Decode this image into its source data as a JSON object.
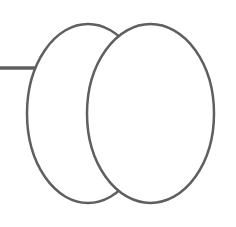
{
  "diagram": {
    "background": "#ffffff",
    "stroke_color": "#5f5f5f",
    "shapes": {
      "connector_line": {
        "x1": 0,
        "y1": 68,
        "x2": 36,
        "y2": 68,
        "stroke_width": 3.5
      },
      "back_ellipse": {
        "cx": 88,
        "cy": 113.5,
        "rx": 61,
        "ry": 89.5,
        "stroke_width": 2.5
      },
      "front_ellipse": {
        "cx": 150.5,
        "cy": 113.5,
        "rx": 63.5,
        "ry": 89.5,
        "stroke_width": 2.5
      }
    }
  }
}
